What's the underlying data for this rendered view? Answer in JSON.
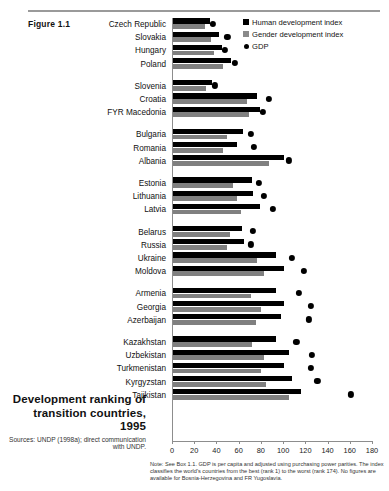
{
  "figure": {
    "label": "Figure 1.1",
    "caption_title": "Development ranking of transition countries, 1995",
    "sources": "Sources: UNDP (1998a); direct communication with UNDP.",
    "note": "Note: See Box 1.1. GDP is per capita and adjusted using purchasing power parities. The index classifies the world's countries from the best (rank 1) to the worst (rank 174). No figures are available for Bosnia-Herzegovina and FR Yugoslavia."
  },
  "legend": {
    "items": [
      {
        "label": "Human development index",
        "marker": "square",
        "color": "#000000"
      },
      {
        "label": "Gender development index",
        "marker": "square",
        "color": "#8a8a8a"
      },
      {
        "label": "GDP",
        "marker": "dot",
        "color": "#000000"
      }
    ]
  },
  "chart_data": {
    "type": "bar",
    "orientation": "horizontal",
    "title": "Development ranking of transition countries, 1995",
    "xlabel": "",
    "ylabel": "",
    "xlim": [
      0,
      180
    ],
    "xticks": [
      0,
      20,
      40,
      60,
      80,
      100,
      120,
      140,
      160,
      180
    ],
    "grid": false,
    "legend_position": "top-right",
    "categories": [
      "Czech Republic",
      "Slovakia",
      "Hungary",
      "Poland",
      "Slovenia",
      "Croatia",
      "FYR Macedonia",
      "Bulgaria",
      "Romania",
      "Albania",
      "Estonia",
      "Lithuania",
      "Latvia",
      "Belarus",
      "Russia",
      "Ukraine",
      "Moldova",
      "Armenia",
      "Georgia",
      "Azerbaijan",
      "Kazakhstan",
      "Uzbekistan",
      "Turkmenistan",
      "Kyrgyzstan",
      "Tajikistan"
    ],
    "group_breaks_after": [
      "Poland",
      "FYR Macedonia",
      "Albania",
      "Latvia",
      "Moldova",
      "Azerbaijan"
    ],
    "series": [
      {
        "name": "Human development index",
        "color": "#000000",
        "values": [
          33,
          41,
          44,
          52,
          35,
          76,
          78,
          63,
          58,
          100,
          71,
          72,
          78,
          62,
          64,
          93,
          100,
          93,
          100,
          97,
          93,
          104,
          100,
          107,
          115
        ]
      },
      {
        "name": "Gender development index",
        "color": "#808080",
        "values": [
          29,
          34,
          37,
          45,
          30,
          67,
          68,
          49,
          45,
          86,
          54,
          58,
          61,
          51,
          49,
          76,
          82,
          70,
          79,
          75,
          71,
          82,
          79,
          84,
          104
        ]
      },
      {
        "name": "GDP",
        "color": "#000000",
        "marker": "dot",
        "values": [
          36,
          49,
          47,
          56,
          38,
          86,
          81,
          70,
          73,
          104,
          77,
          82,
          90,
          72,
          70,
          107,
          118,
          113,
          124,
          122,
          111,
          125,
          124,
          130,
          160
        ]
      }
    ]
  }
}
